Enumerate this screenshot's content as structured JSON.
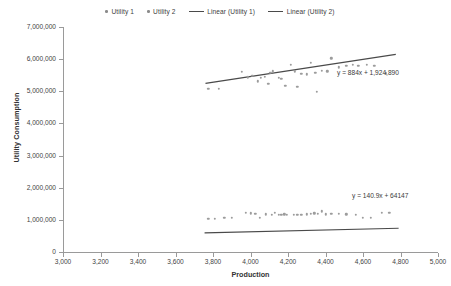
{
  "chart_data": {
    "type": "scatter",
    "title": "",
    "xlabel": "Production",
    "ylabel": "Utility Consumption",
    "xlim": [
      3000,
      5000
    ],
    "ylim": [
      0,
      7000000
    ],
    "grid": false,
    "legend_position": "top-center",
    "x_ticks": [
      "3,000",
      "3,200",
      "3,400",
      "3,600",
      "3,800",
      "4,000",
      "4,200",
      "4,400",
      "4,600",
      "4,800",
      "5,000"
    ],
    "x_tick_values": [
      3000,
      3200,
      3400,
      3600,
      3800,
      4000,
      4200,
      4400,
      4600,
      4800,
      5000
    ],
    "y_ticks": [
      "0",
      "1,000,000",
      "2,000,000",
      "3,000,000",
      "4,000,000",
      "5,000,000",
      "6,000,000",
      "7,000,000"
    ],
    "y_tick_values": [
      0,
      1000000,
      2000000,
      3000000,
      4000000,
      5000000,
      6000000,
      7000000
    ],
    "legend": [
      {
        "label": "Utility 1",
        "marker": "dot",
        "color": "#8b8b8b"
      },
      {
        "label": "Utility 2",
        "marker": "dot",
        "color": "#8b8b8b"
      },
      {
        "label": "Linear (Utility 1)",
        "marker": "line",
        "color": "#4a4a4a"
      },
      {
        "label": "Linear (Utility 2)",
        "marker": "line",
        "color": "#4a4a4a"
      }
    ],
    "series": [
      {
        "name": "Utility 1",
        "marker_color": "#9c9c9c",
        "points": [
          [
            3775,
            5080000
          ],
          [
            3830,
            5080000
          ],
          [
            3955,
            5600000
          ],
          [
            3985,
            5430000
          ],
          [
            4010,
            5490000
          ],
          [
            4040,
            5310000
          ],
          [
            4055,
            5420000
          ],
          [
            4075,
            5445000
          ],
          [
            4095,
            5240000
          ],
          [
            4105,
            5570000
          ],
          [
            4120,
            5620000
          ],
          [
            4150,
            5420000
          ],
          [
            4165,
            5380000
          ],
          [
            4185,
            5175000
          ],
          [
            4215,
            5830000
          ],
          [
            4235,
            5620000
          ],
          [
            4250,
            5145000
          ],
          [
            4270,
            5540000
          ],
          [
            4300,
            5530000
          ],
          [
            4320,
            5880000
          ],
          [
            4345,
            5570000
          ],
          [
            4355,
            4990000
          ],
          [
            4380,
            5640000
          ],
          [
            4410,
            5620000
          ],
          [
            4430,
            6030000
          ],
          [
            4470,
            5745000
          ],
          [
            4510,
            5790000
          ],
          [
            4545,
            5830000
          ],
          [
            4575,
            5800000
          ],
          [
            4620,
            5815000
          ],
          [
            4660,
            5790000
          ],
          [
            4720,
            5560000
          ]
        ]
      },
      {
        "name": "Utility 2",
        "marker_color": "#9c9c9c",
        "points": [
          [
            3775,
            1030000
          ],
          [
            3810,
            1030000
          ],
          [
            3860,
            1060000
          ],
          [
            3900,
            1060000
          ],
          [
            3975,
            1215000
          ],
          [
            4000,
            1200000
          ],
          [
            4025,
            1180000
          ],
          [
            4050,
            1060000
          ],
          [
            4080,
            1175000
          ],
          [
            4115,
            1160000
          ],
          [
            4130,
            1225000
          ],
          [
            4150,
            1160000
          ],
          [
            4165,
            1150000
          ],
          [
            4180,
            1175000
          ],
          [
            4195,
            1150000
          ],
          [
            4230,
            1150000
          ],
          [
            4250,
            1160000
          ],
          [
            4270,
            1150000
          ],
          [
            4300,
            1175000
          ],
          [
            4320,
            1185000
          ],
          [
            4340,
            1205000
          ],
          [
            4360,
            1185000
          ],
          [
            4380,
            1265000
          ],
          [
            4400,
            1170000
          ],
          [
            4430,
            1190000
          ],
          [
            4470,
            1180000
          ],
          [
            4510,
            1170000
          ],
          [
            4560,
            1155000
          ],
          [
            4600,
            1065000
          ],
          [
            4640,
            1060000
          ],
          [
            4700,
            1210000
          ],
          [
            4740,
            1210000
          ]
        ]
      }
    ],
    "trendlines": [
      {
        "name": "Linear (Utility 1)",
        "equation": "y = 884x + 1,924,890",
        "slope": 884,
        "intercept": 1924890,
        "x_start": 3760,
        "x_end": 4775,
        "color": "#4a4a4a"
      },
      {
        "name": "Linear (Utility 2)",
        "equation": "y = 140.9x + 64147",
        "slope": 140.9,
        "intercept": 64147,
        "x_start": 3755,
        "x_end": 4790,
        "color": "#4a4a4a"
      }
    ]
  }
}
